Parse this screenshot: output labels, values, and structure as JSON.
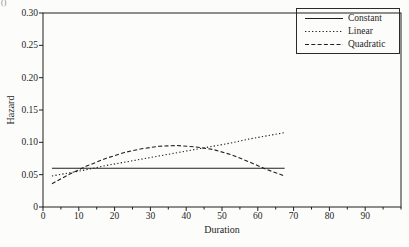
{
  "page": {
    "corner_mark": "()"
  },
  "colors": {
    "ink": "#1f1f1f",
    "paper": "#fcfcfa"
  },
  "chart_data": {
    "type": "line",
    "title": "",
    "xlabel": "Duration",
    "ylabel": "Hazard",
    "xlim": [
      0,
      100
    ],
    "ylim": [
      0,
      0.3
    ],
    "x_major_ticks": [
      0,
      10,
      20,
      30,
      40,
      50,
      60,
      70,
      80,
      90
    ],
    "x_minor_tick_step": 5,
    "y_ticks": [
      0,
      0.05,
      0.1,
      0.15,
      0.2,
      0.25,
      0.3
    ],
    "y_tick_labels": [
      "0",
      "0.05",
      "0.10",
      "0.15",
      "0.20",
      "0.25",
      "0.30"
    ],
    "grid": false,
    "legend_position": "top-right",
    "x": [
      2.5,
      7.5,
      12.5,
      17.5,
      22.5,
      27.5,
      32.5,
      37.5,
      42.5,
      47.5,
      52.5,
      57.5,
      62.5,
      67.5
    ],
    "series": [
      {
        "name": "Constant",
        "style": "solid",
        "color": "#1f1f1f",
        "values": [
          0.06,
          0.06,
          0.06,
          0.06,
          0.06,
          0.06,
          0.06,
          0.06,
          0.06,
          0.06,
          0.06,
          0.06,
          0.06,
          0.06
        ]
      },
      {
        "name": "Linear",
        "style": "dotted",
        "color": "#1f1f1f",
        "values": [
          0.048,
          0.053,
          0.058,
          0.064,
          0.069,
          0.074,
          0.079,
          0.084,
          0.089,
          0.094,
          0.099,
          0.105,
          0.11,
          0.115
        ]
      },
      {
        "name": "Quadratic",
        "style": "dashed",
        "color": "#1f1f1f",
        "values": [
          0.036,
          0.051,
          0.064,
          0.075,
          0.084,
          0.09,
          0.094,
          0.095,
          0.093,
          0.089,
          0.081,
          0.07,
          0.058,
          0.048
        ]
      }
    ]
  }
}
